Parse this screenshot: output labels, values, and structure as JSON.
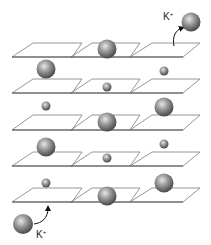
{
  "diagram": {
    "colors": {
      "plane_stroke": "#8a8a8a",
      "plane_stroke_dark": "#555555",
      "sphere_light": "#e6e6e6",
      "sphere_mid": "#8c8c8c",
      "sphere_dark": "#4a4a4a",
      "arrow": "#111111"
    },
    "layers": [
      {
        "row": 1,
        "top_y": 43,
        "bottom_y": 57
      },
      {
        "row": 2,
        "top_y": 79,
        "bottom_y": 93
      },
      {
        "row": 3,
        "top_y": 115,
        "bottom_y": 130
      },
      {
        "row": 4,
        "top_y": 152,
        "bottom_y": 166
      },
      {
        "row": 5,
        "top_y": 188,
        "bottom_y": 202
      }
    ],
    "columns": [
      {
        "bottom_left_x": 12,
        "bottom_right_x": 72,
        "top_left_x": 33,
        "top_right_x": 82
      },
      {
        "bottom_left_x": 71,
        "bottom_right_x": 130,
        "top_left_x": 92,
        "top_right_x": 140
      },
      {
        "bottom_left_x": 130,
        "bottom_right_x": 183,
        "top_left_x": 152,
        "top_right_x": 200
      }
    ],
    "spheres": [
      {
        "cx": 107,
        "cy": 49,
        "size": "large"
      },
      {
        "cx": 46,
        "cy": 69,
        "size": "large"
      },
      {
        "cx": 164,
        "cy": 71,
        "size": "small"
      },
      {
        "cx": 107,
        "cy": 87,
        "size": "small"
      },
      {
        "cx": 46,
        "cy": 106,
        "size": "small"
      },
      {
        "cx": 164,
        "cy": 107,
        "size": "large"
      },
      {
        "cx": 107,
        "cy": 122,
        "size": "large"
      },
      {
        "cx": 46,
        "cy": 147,
        "size": "large"
      },
      {
        "cx": 164,
        "cy": 144,
        "size": "small"
      },
      {
        "cx": 107,
        "cy": 158,
        "size": "small"
      },
      {
        "cx": 46,
        "cy": 183,
        "size": "small"
      },
      {
        "cx": 164,
        "cy": 183,
        "size": "large"
      },
      {
        "cx": 107,
        "cy": 196,
        "size": "large"
      }
    ],
    "ions": {
      "exiting": {
        "label": "K",
        "charge": "+",
        "cx": 191,
        "cy": 22
      },
      "entering": {
        "label": "K",
        "charge": "+",
        "cx": 23,
        "cy": 224
      }
    }
  }
}
